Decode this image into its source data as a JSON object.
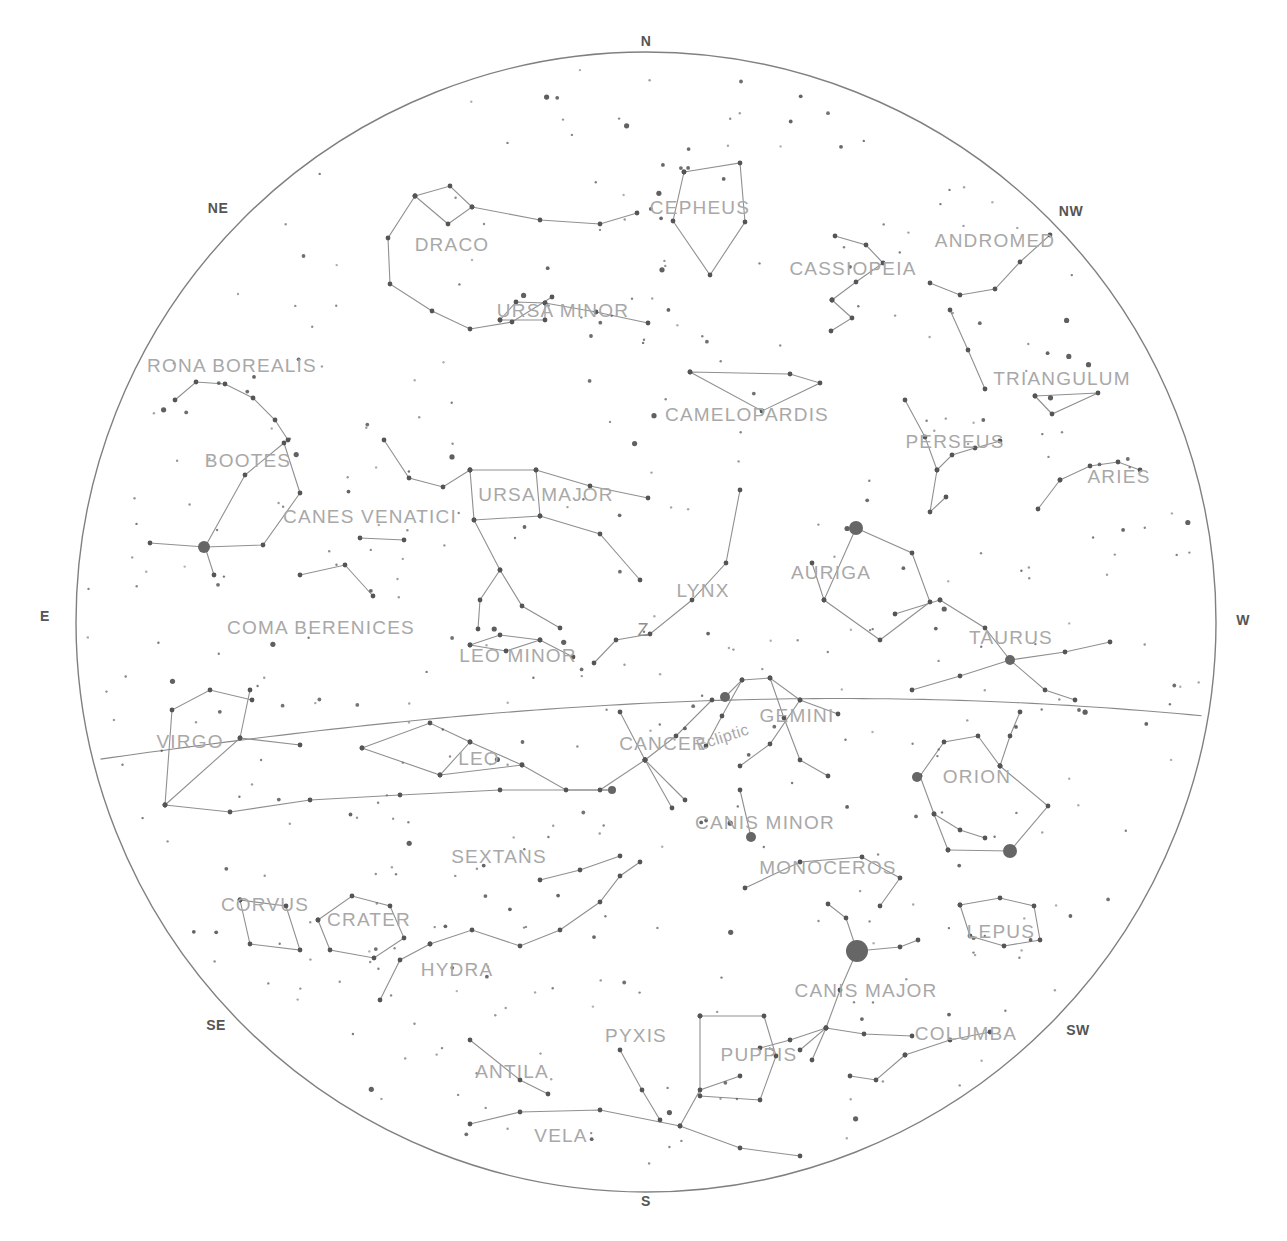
{
  "chart_data": {
    "type": "scatter",
    "subtitle": "Northern horizon view with constellation figures, ecliptic and zenith",
    "xlabel": "",
    "ylabel": "",
    "grid": false,
    "legend_position": "none",
    "projection": "azimuthal (horizon circle)",
    "horizon": {
      "center_x": 646,
      "center_y": 622,
      "radius": 570,
      "stroke": "#808080"
    },
    "zenith": {
      "label": "Z",
      "x": 643,
      "y": 630
    },
    "ecliptic": {
      "label": "Ecliptic",
      "label_x": 724,
      "label_y": 746,
      "label_rotation": -18,
      "stroke": "#8a8a8a"
    },
    "colors": {
      "background": "#ffffff",
      "horizon_line": "#808080",
      "constellation_line": "#909090",
      "star": "#555555",
      "bright_star": "#666666",
      "label_text": "#a8a8a8",
      "cardinal_text": "#555555"
    },
    "cardinals": [
      {
        "label": "N",
        "x": 646,
        "y": 41
      },
      {
        "label": "NE",
        "x": 218,
        "y": 208
      },
      {
        "label": "NW",
        "x": 1071,
        "y": 211
      },
      {
        "label": "E",
        "x": 45,
        "y": 616
      },
      {
        "label": "W",
        "x": 1243,
        "y": 620
      },
      {
        "label": "SE",
        "x": 216,
        "y": 1025
      },
      {
        "label": "SW",
        "x": 1078,
        "y": 1030
      },
      {
        "label": "S",
        "x": 646,
        "y": 1201
      }
    ],
    "constellations": [
      {
        "name": "CEPHEUS",
        "x": 700,
        "y": 208
      },
      {
        "name": "DRACO",
        "x": 452,
        "y": 245
      },
      {
        "name": "CASSIOPEIA",
        "x": 853,
        "y": 269
      },
      {
        "name": "ANDROMED",
        "x": 995,
        "y": 241
      },
      {
        "name": "URSA MINOR",
        "x": 563,
        "y": 311
      },
      {
        "name": "RONA BOREALIS",
        "x": 232,
        "y": 366
      },
      {
        "name": "TRIANGULUM",
        "x": 1062,
        "y": 379
      },
      {
        "name": "CAMELOPARDIS",
        "x": 747,
        "y": 415
      },
      {
        "name": "PERSEUS",
        "x": 955,
        "y": 442
      },
      {
        "name": "BOOTES",
        "x": 248,
        "y": 461
      },
      {
        "name": "ARIES",
        "x": 1119,
        "y": 477
      },
      {
        "name": "URSA MAJOR",
        "x": 546,
        "y": 495
      },
      {
        "name": "CANES VENATICI",
        "x": 370,
        "y": 517
      },
      {
        "name": "AURIGA",
        "x": 831,
        "y": 573
      },
      {
        "name": "LYNX",
        "x": 703,
        "y": 591
      },
      {
        "name": "COMA BERENICES",
        "x": 321,
        "y": 628
      },
      {
        "name": "TAURUS",
        "x": 1011,
        "y": 638
      },
      {
        "name": "LEO MINOR",
        "x": 518,
        "y": 656
      },
      {
        "name": "GEMINI",
        "x": 797,
        "y": 716
      },
      {
        "name": "CANCER",
        "x": 663,
        "y": 744
      },
      {
        "name": "VIRGO",
        "x": 190,
        "y": 742
      },
      {
        "name": "LEO",
        "x": 479,
        "y": 759
      },
      {
        "name": "ORION",
        "x": 977,
        "y": 777
      },
      {
        "name": "CANIS MINOR",
        "x": 765,
        "y": 823
      },
      {
        "name": "SEXTANS",
        "x": 499,
        "y": 857
      },
      {
        "name": "MONOCEROS",
        "x": 828,
        "y": 868
      },
      {
        "name": "CORVUS",
        "x": 265,
        "y": 905
      },
      {
        "name": "CRATER",
        "x": 369,
        "y": 920
      },
      {
        "name": "LEPUS",
        "x": 1001,
        "y": 932
      },
      {
        "name": "HYDRA",
        "x": 457,
        "y": 970
      },
      {
        "name": "CANIS MAJOR",
        "x": 866,
        "y": 991
      },
      {
        "name": "PYXIS",
        "x": 636,
        "y": 1036
      },
      {
        "name": "COLUMBA",
        "x": 966,
        "y": 1034
      },
      {
        "name": "PUPPIS",
        "x": 759,
        "y": 1055
      },
      {
        "name": "ANTILA",
        "x": 512,
        "y": 1072
      },
      {
        "name": "VELA",
        "x": 561,
        "y": 1136
      }
    ],
    "bright_stars": [
      {
        "name": "Sirius",
        "x": 857,
        "y": 951,
        "r": 11
      },
      {
        "name": "Capella",
        "x": 856,
        "y": 528,
        "r": 7
      },
      {
        "name": "Rigel",
        "x": 1010,
        "y": 851,
        "r": 7
      },
      {
        "name": "Betelgeuse",
        "x": 917,
        "y": 777,
        "r": 5
      },
      {
        "name": "Arcturus",
        "x": 204,
        "y": 547,
        "r": 6
      },
      {
        "name": "Procyon",
        "x": 751,
        "y": 837,
        "r": 5
      },
      {
        "name": "Aldebaran",
        "x": 1010,
        "y": 660,
        "r": 5
      },
      {
        "name": "Pollux",
        "x": 725,
        "y": 697,
        "r": 5
      },
      {
        "name": "Regulus",
        "x": 612,
        "y": 790,
        "r": 4
      }
    ],
    "star_count_approx": 420
  }
}
